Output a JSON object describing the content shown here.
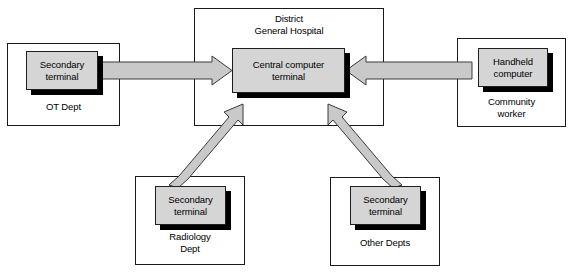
{
  "diagram": {
    "canvas": {
      "width": 572,
      "height": 274
    },
    "colors": {
      "node_face": "#d5d5d5",
      "node_border": "#1f1f1f",
      "node_shadow": "#000000",
      "zone_border": "#1a1a1a",
      "arrow_fill": "#c9c9c9",
      "arrow_stroke": "#3a3a3a",
      "background": "#ffffff",
      "text": "#000000"
    },
    "zones": [
      {
        "id": "ot-dept",
        "label": "OT Dept"
      },
      {
        "id": "hospital",
        "label": "District\nGeneral Hospital"
      },
      {
        "id": "community-worker",
        "label": "Community\nworker"
      },
      {
        "id": "radiology-dept",
        "label": "Radiology\nDept"
      },
      {
        "id": "other-depts",
        "label": "Other Depts"
      }
    ],
    "nodes": [
      {
        "id": "ot-terminal",
        "label": "Secondary\nterminal"
      },
      {
        "id": "central-terminal",
        "label": "Central computer\nterminal"
      },
      {
        "id": "handheld-computer",
        "label": "Handheld\ncomputer"
      },
      {
        "id": "radiology-terminal",
        "label": "Secondary\nterminal"
      },
      {
        "id": "other-terminal",
        "label": "Secondary\nterminal"
      }
    ],
    "connections": [
      {
        "id": "ot-to-central",
        "from": "ot-terminal",
        "to": "central-terminal",
        "direction": "right",
        "style": "block-arrow"
      },
      {
        "id": "handheld-to-central",
        "from": "handheld-computer",
        "to": "central-terminal",
        "direction": "left",
        "style": "block-arrow"
      },
      {
        "id": "radiology-to-central",
        "from": "radiology-terminal",
        "to": "central-terminal",
        "direction": "up-right",
        "style": "block-arrow"
      },
      {
        "id": "other-to-central",
        "from": "other-terminal",
        "to": "central-terminal",
        "direction": "up-left",
        "style": "block-arrow"
      }
    ]
  }
}
